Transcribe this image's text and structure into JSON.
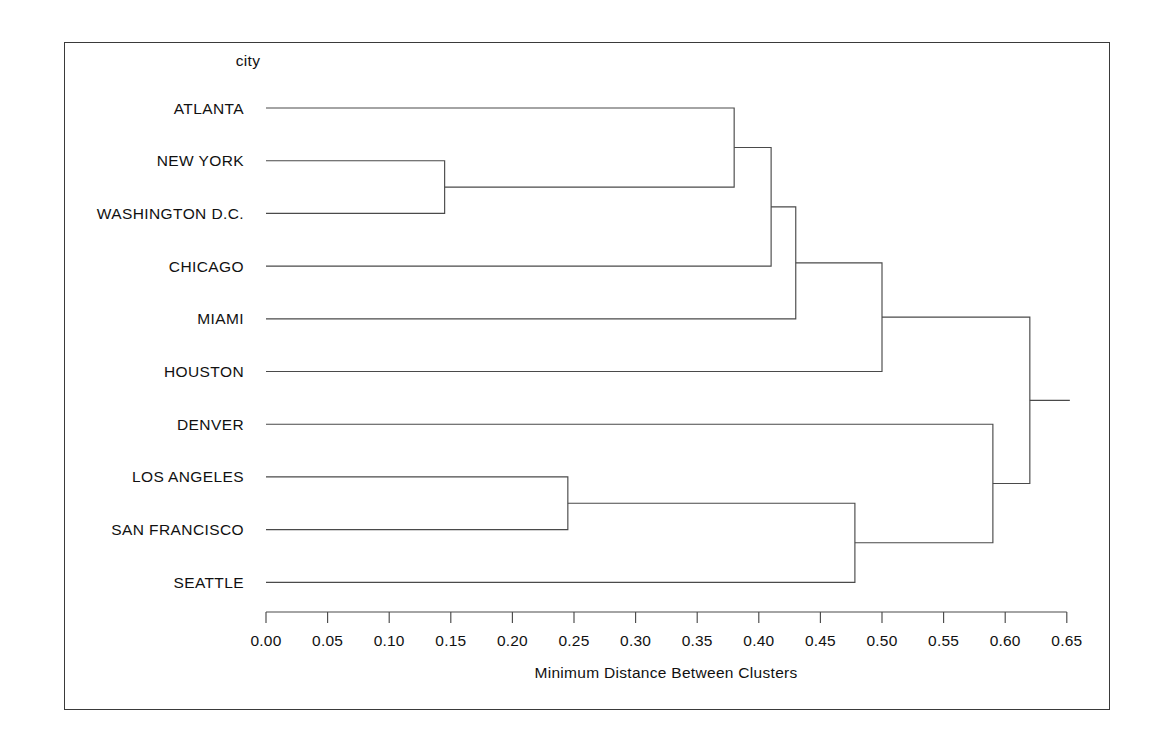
{
  "figure": {
    "column_title": "city",
    "axis_title": "Minimum Distance Between Clusters",
    "border_color": "#3a3a3a",
    "line_color": "#4a4a4a",
    "background": "#ffffff"
  },
  "axis": {
    "ticks": [
      "0.00",
      "0.05",
      "0.10",
      "0.15",
      "0.20",
      "0.25",
      "0.30",
      "0.35",
      "0.40",
      "0.45",
      "0.50",
      "0.55",
      "0.60",
      "0.65"
    ],
    "tick_values": [
      0.0,
      0.05,
      0.1,
      0.15,
      0.2,
      0.25,
      0.3,
      0.35,
      0.4,
      0.45,
      0.5,
      0.55,
      0.6,
      0.65
    ],
    "min": 0.0,
    "max": 0.65
  },
  "chart_data": {
    "type": "dendrogram",
    "title": "city",
    "xlabel": "Minimum Distance Between Clusters",
    "ylabel": "",
    "xlim": [
      0.0,
      0.65
    ],
    "grid": false,
    "legend": "none",
    "orientation": "horizontal",
    "leaves": [
      "ATLANTA",
      "NEW YORK",
      "WASHINGTON D.C.",
      "CHICAGO",
      "MIAMI",
      "HOUSTON",
      "DENVER",
      "LOS ANGELES",
      "SAN FRANCISCO",
      "SEATTLE"
    ],
    "merges": [
      {
        "id": "m1",
        "left": "NEW YORK",
        "right": "WASHINGTON D.C.",
        "distance": 0.145
      },
      {
        "id": "m2",
        "left": "ATLANTA",
        "right": "m1",
        "distance": 0.38
      },
      {
        "id": "m3",
        "left": "LOS ANGELES",
        "right": "SAN FRANCISCO",
        "distance": 0.245
      },
      {
        "id": "m4",
        "left": "m2",
        "right": "CHICAGO",
        "distance": 0.41
      },
      {
        "id": "m5",
        "left": "m4",
        "right": "MIAMI",
        "distance": 0.43
      },
      {
        "id": "m6",
        "left": "m3",
        "right": "SEATTLE",
        "distance": 0.478
      },
      {
        "id": "m7",
        "left": "m5",
        "right": "HOUSTON",
        "distance": 0.5
      },
      {
        "id": "m8",
        "left": "m6",
        "right": "DENVER",
        "distance": 0.59
      },
      {
        "id": "m9",
        "left": "m7",
        "right": "m8",
        "distance": 0.62
      }
    ]
  }
}
